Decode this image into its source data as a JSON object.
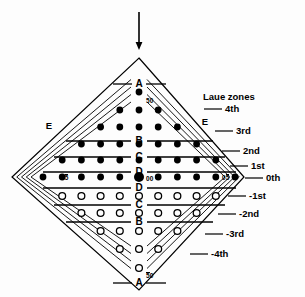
{
  "figure": {
    "type": "laue-zone-diffraction-diagram",
    "background_color": "#fdfdfd",
    "ink_color": "#000000",
    "title_text": "Laue zones",
    "incident_beam_arrow": {
      "name": "incident-beam-arrow",
      "direction": "down",
      "x": 139,
      "y_start": 12,
      "y_end": 50
    },
    "diamond": {
      "top": {
        "x": 139,
        "y": 58
      },
      "right": {
        "x": 244,
        "y": 177
      },
      "bottom": {
        "x": 139,
        "y": 290
      },
      "left": {
        "x": 12,
        "y": 177
      }
    }
  },
  "zone_labels": [
    {
      "text": "4th",
      "y": 109,
      "leader_x1": 204,
      "leader_x2": 222,
      "text_x": 225
    },
    {
      "text": "3rd",
      "y": 131,
      "leader_x1": 215,
      "leader_x2": 233,
      "text_x": 236
    },
    {
      "text": "2nd",
      "y": 151,
      "leader_x1": 222,
      "leader_x2": 240,
      "text_x": 243
    },
    {
      "text": "1st",
      "y": 166,
      "leader_x1": 230,
      "leader_x2": 248,
      "text_x": 251
    },
    {
      "text": "0th",
      "y": 178,
      "leader_x1": 245,
      "leader_x2": 263,
      "text_x": 266
    },
    {
      "text": "-1st",
      "y": 196,
      "leader_x1": 228,
      "leader_x2": 246,
      "text_x": 249
    },
    {
      "text": "-2nd",
      "y": 214,
      "leader_x1": 218,
      "leader_x2": 236,
      "text_x": 239
    },
    {
      "text": "-3rd",
      "y": 234,
      "leader_x1": 205,
      "leader_x2": 223,
      "text_x": 226
    },
    {
      "text": "-4th",
      "y": 254,
      "leader_x1": 190,
      "leader_x2": 208,
      "text_x": 211
    }
  ],
  "center_letters": [
    {
      "text": "A",
      "x": 139,
      "y": 84
    },
    {
      "text": "B",
      "x": 139,
      "y": 141
    },
    {
      "text": "C",
      "x": 139,
      "y": 157
    },
    {
      "text": "D",
      "x": 139,
      "y": 172
    },
    {
      "text": "D",
      "x": 139,
      "y": 188
    },
    {
      "text": "C",
      "x": 139,
      "y": 205
    },
    {
      "text": "B",
      "x": 139,
      "y": 222
    },
    {
      "text": "A",
      "x": 139,
      "y": 283
    }
  ],
  "edge_letters": [
    {
      "text": "E",
      "x": 49,
      "y": 126,
      "side": "left"
    },
    {
      "text": "E",
      "x": 205,
      "y": 122,
      "side": "right"
    }
  ],
  "spot_indices": [
    {
      "text": "50",
      "bar": "none",
      "x": 146,
      "y": 98,
      "anchor_dot": "top-filled"
    },
    {
      "text": "00",
      "bar": "none",
      "x": 146,
      "y": 176,
      "anchor_dot": "origin"
    },
    {
      "text": "05",
      "bar": "last",
      "x": 61,
      "y": 174,
      "anchor_dot": "left-end-0th"
    },
    {
      "text": "05",
      "bar": "last",
      "x": 222,
      "y": 174,
      "anchor_dot": "right-end-0th"
    },
    {
      "text": "50",
      "bar": "first",
      "x": 146,
      "y": 272,
      "anchor_dot": "bottom-open"
    }
  ],
  "chart_data": {
    "type": "scatter",
    "title": "Laue zones",
    "xlabel": "",
    "ylabel": "",
    "grid": false,
    "legend_position": "right",
    "spacing": {
      "dx": 19.2,
      "dy": 17.4
    },
    "origin_px": {
      "x": 139,
      "y": 177
    },
    "series": [
      {
        "name": "filled-spots",
        "marker": "filled-circle",
        "color": "#000000",
        "radius": 3.4,
        "rows": [
          {
            "row": 6,
            "y": 92,
            "xs": [
              0
            ]
          },
          {
            "row": 5,
            "y": 110,
            "xs": [
              -1,
              0,
              1
            ]
          },
          {
            "row": 4,
            "y": 127,
            "xs": [
              -2,
              -1,
              0,
              1,
              2
            ]
          },
          {
            "row": 3,
            "y": 144,
            "xs": [
              -3,
              -2,
              -1,
              0,
              1,
              2,
              3
            ]
          },
          {
            "row": 2,
            "y": 160,
            "xs": [
              -4,
              -3,
              -2,
              -1,
              0,
              1,
              2,
              3,
              4
            ]
          },
          {
            "row": 1,
            "y": 177,
            "xs": [
              -5,
              -4,
              -3,
              -2,
              -1,
              0,
              1,
              2,
              3,
              4,
              5
            ]
          }
        ]
      },
      {
        "name": "open-spots",
        "marker": "open-circle",
        "color": "#000000",
        "radius": 3.4,
        "rows": [
          {
            "row": -1,
            "y": 196,
            "xs": [
              -4,
              -3,
              -2,
              -1,
              0,
              1,
              2,
              3,
              4
            ]
          },
          {
            "row": -2,
            "y": 213,
            "xs": [
              -3,
              -2,
              -1,
              0,
              1,
              2,
              3
            ]
          },
          {
            "row": -3,
            "y": 231,
            "xs": [
              -2,
              -1,
              0,
              1,
              2
            ]
          },
          {
            "row": -4,
            "y": 249,
            "xs": [
              -1,
              0,
              1
            ]
          },
          {
            "row": -5,
            "y": 268,
            "xs": [
              0
            ]
          }
        ]
      }
    ],
    "origin_marker": {
      "name": "origin-spot",
      "x": 0,
      "y": 177,
      "radius": 5.0,
      "marker": "filled-circle"
    }
  },
  "zone_lines": [
    {
      "name": "zone-line-B-upper",
      "y": 141,
      "left_x1": 66,
      "left_x2": 131,
      "right_x1": 147,
      "right_x2": 213
    },
    {
      "name": "zone-line-C-upper",
      "y": 157,
      "left_x1": 54,
      "left_x2": 131,
      "right_x1": 147,
      "right_x2": 225
    },
    {
      "name": "zone-line-D-upper",
      "y": 172,
      "left_x1": 43,
      "left_x2": 131,
      "right_x1": 147,
      "right_x2": 236
    },
    {
      "name": "zone-line-D-lower",
      "y": 188,
      "left_x1": 43,
      "left_x2": 131,
      "right_x1": 147,
      "right_x2": 236
    },
    {
      "name": "zone-line-C-lower",
      "y": 205,
      "left_x1": 54,
      "left_x2": 131,
      "right_x1": 147,
      "right_x2": 225
    },
    {
      "name": "zone-line-B-lower",
      "y": 222,
      "left_x1": 66,
      "left_x2": 131,
      "right_x1": 147,
      "right_x2": 213
    },
    {
      "name": "zone-line-A-top",
      "y": 84,
      "left_x1": 113,
      "left_x2": 132,
      "right_x1": 146,
      "right_x2": 166
    },
    {
      "name": "zone-line-A-bottom",
      "y": 283,
      "left_x1": 113,
      "left_x2": 132,
      "right_x1": 146,
      "right_x2": 166
    }
  ],
  "chevrons": [
    {
      "name": "chevron-0th",
      "inset": 0
    },
    {
      "name": "chevron-1st",
      "inset": 5
    },
    {
      "name": "chevron-2nd",
      "inset": 10
    },
    {
      "name": "chevron-3rd",
      "inset": 15
    },
    {
      "name": "chevron-4th",
      "inset": 20
    }
  ]
}
